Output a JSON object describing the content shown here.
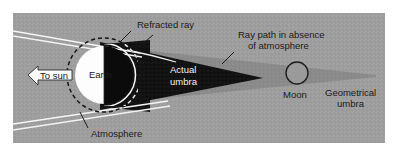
{
  "figure": {
    "panel_background_color": "#9e9e9e",
    "page_background_color": "#ffffff",
    "umbra_color": "#111111",
    "geometrical_umbra_color": "#8a8a8a",
    "earth_lit_color": "#fdfdfd",
    "earth_dark_color": "#0d0d0d",
    "ray_color": "#f4f4f4",
    "label_color": "#1b1b1b",
    "label_color_on_dark": "#f2f2f2"
  },
  "labels": {
    "to_sun": "To sun",
    "earth": "Earth",
    "atmosphere": "Atmosphere",
    "refracted_ray": "Refracted ray",
    "actual_umbra_line1": "Actual",
    "actual_umbra_line2": "umbra",
    "ray_path_line1": "Ray path in absence",
    "ray_path_line2": "of atmosphere",
    "moon": "Moon",
    "geometrical_umbra_line1": "Geometrical",
    "geometrical_umbra_line2": "umbra"
  },
  "geometry": {
    "panel": {
      "x": 13,
      "y": 13,
      "width": 372,
      "height": 130
    },
    "earth": {
      "cx": 104,
      "cy": 75,
      "r": 29
    },
    "atmosphere_circle": {
      "cx": 104,
      "cy": 75,
      "r": 37
    },
    "moon": {
      "cx": 297,
      "cy": 73,
      "r": 11
    },
    "umbra_apex": {
      "x": 263,
      "y": 78
    },
    "geometrical_umbra_apex": {
      "x": 376,
      "y": 76
    }
  }
}
